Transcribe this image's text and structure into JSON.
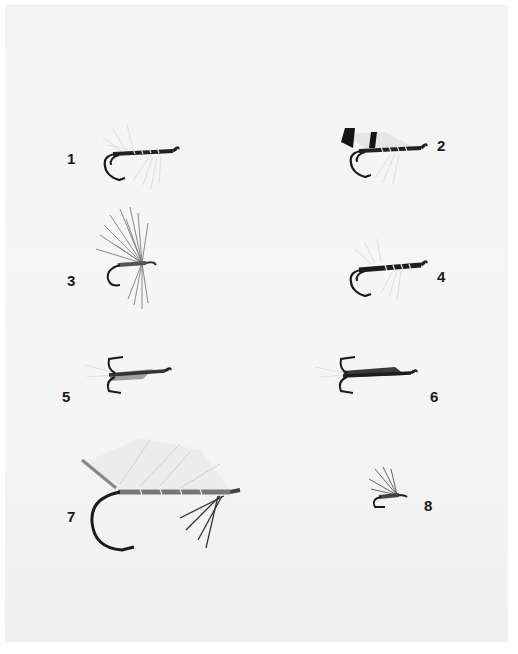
{
  "plate": {
    "background": "#f4f4f4",
    "flies": [
      {
        "number": "1",
        "style": "double hook, grey hackle, silver-ribbed black body"
      },
      {
        "number": "2",
        "style": "double hook, barred black-and-white wing"
      },
      {
        "number": "3",
        "style": "single hook, bushy grey hackle"
      },
      {
        "number": "4",
        "style": "double hook, black body, silver rib"
      },
      {
        "number": "5",
        "style": "treble hook, dark body"
      },
      {
        "number": "6",
        "style": "treble hook, dark wing"
      },
      {
        "number": "7",
        "style": "large single hook, white bucktail wing, silver body"
      },
      {
        "number": "8",
        "style": "small single hook, dark hackle"
      }
    ]
  }
}
